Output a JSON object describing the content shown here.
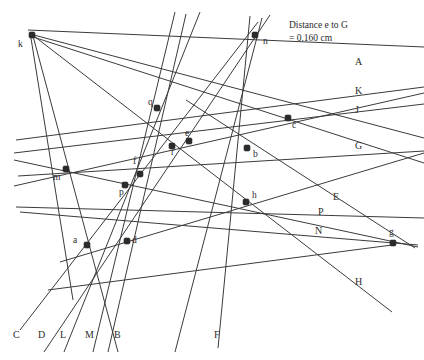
{
  "figure": {
    "width": 424,
    "height": 360,
    "background": "#ffffff",
    "stroke_color": "#3b3b3b",
    "point_color": "#2b2b2b",
    "text_color": "#2b2b2b"
  },
  "measurement": {
    "line1": "Distance e to G",
    "line2": "= 0.160 cm",
    "x": 289,
    "y": 28
  },
  "points": [
    {
      "id": "k",
      "label": "k",
      "x": 32,
      "y": 35,
      "lx": 18,
      "ly": 47
    },
    {
      "id": "n",
      "label": "n",
      "x": 255,
      "y": 35,
      "lx": 263,
      "ly": 44
    },
    {
      "id": "q",
      "label": "q",
      "x": 157,
      "y": 108,
      "lx": 148,
      "ly": 105
    },
    {
      "id": "c",
      "label": "c",
      "x": 288,
      "y": 118,
      "lx": 292,
      "ly": 128
    },
    {
      "id": "e",
      "label": "e",
      "x": 189,
      "y": 141,
      "lx": 185,
      "ly": 136
    },
    {
      "id": "r",
      "label": "r",
      "x": 172,
      "y": 146,
      "lx": 171,
      "ly": 155
    },
    {
      "id": "b",
      "label": "b",
      "x": 247,
      "y": 148,
      "lx": 253,
      "ly": 157
    },
    {
      "id": "m",
      "label": "m",
      "x": 66,
      "y": 169,
      "lx": 53,
      "ly": 180
    },
    {
      "id": "f",
      "label": "f",
      "x": 140,
      "y": 174,
      "lx": 133,
      "ly": 164
    },
    {
      "id": "p",
      "label": "p",
      "x": 125,
      "y": 185,
      "lx": 119,
      "ly": 195
    },
    {
      "id": "h",
      "label": "h",
      "x": 246,
      "y": 202,
      "lx": 252,
      "ly": 198
    },
    {
      "id": "g",
      "label": "g",
      "x": 393,
      "y": 243,
      "lx": 389,
      "ly": 235
    },
    {
      "id": "a",
      "label": "a",
      "x": 87,
      "y": 245,
      "lx": 73,
      "ly": 243
    },
    {
      "id": "d",
      "label": "d",
      "x": 127,
      "y": 241,
      "lx": 132,
      "ly": 243
    }
  ],
  "line_labels": [
    {
      "id": "A",
      "label": "A",
      "x": 355,
      "y": 65
    },
    {
      "id": "K",
      "label": "K",
      "x": 355,
      "y": 94
    },
    {
      "id": "J",
      "label": "J",
      "x": 355,
      "y": 113
    },
    {
      "id": "G",
      "label": "G",
      "x": 355,
      "y": 149
    },
    {
      "id": "E",
      "label": "E",
      "x": 333,
      "y": 200
    },
    {
      "id": "P",
      "label": "P",
      "x": 318,
      "y": 215
    },
    {
      "id": "N",
      "label": "N",
      "x": 315,
      "y": 234
    },
    {
      "id": "H",
      "label": "H",
      "x": 355,
      "y": 285
    },
    {
      "id": "C",
      "label": "C",
      "x": 13,
      "y": 338
    },
    {
      "id": "D",
      "label": "D",
      "x": 38,
      "y": 338
    },
    {
      "id": "L",
      "label": "L",
      "x": 60,
      "y": 338
    },
    {
      "id": "M",
      "label": "M",
      "x": 85,
      "y": 338
    },
    {
      "id": "B",
      "label": "B",
      "x": 114,
      "y": 338
    },
    {
      "id": "F",
      "label": "F",
      "x": 214,
      "y": 338
    }
  ],
  "lines": [
    {
      "id": "line-A",
      "name": "line-A-through-c-to-k",
      "x1": 28,
      "y1": 30,
      "x2": 424,
      "y2": 47
    },
    {
      "id": "line-K",
      "name": "line-K-through-c",
      "x1": 16,
      "y1": 140,
      "x2": 424,
      "y2": 87
    },
    {
      "id": "line-J",
      "name": "line-J-through-b-c",
      "x1": 14,
      "y1": 153,
      "x2": 424,
      "y2": 104
    },
    {
      "id": "line-G",
      "name": "line-G-horizontal",
      "x1": 18,
      "y1": 176,
      "x2": 424,
      "y2": 151
    },
    {
      "id": "line-E",
      "name": "line-E-to-g",
      "x1": 186,
      "y1": 100,
      "x2": 415,
      "y2": 248
    },
    {
      "id": "line-P",
      "name": "line-P-h-to-g",
      "x1": 14,
      "y1": 160,
      "x2": 418,
      "y2": 247
    },
    {
      "id": "line-N",
      "name": "line-N-h-to-g",
      "x1": 20,
      "y1": 212,
      "x2": 418,
      "y2": 245
    },
    {
      "id": "line-H",
      "name": "line-H-from-k",
      "x1": 30,
      "y1": 33,
      "x2": 392,
      "y2": 312
    },
    {
      "id": "line-C",
      "name": "line-C-from-n",
      "x1": 258,
      "y1": 22,
      "x2": 20,
      "y2": 330
    },
    {
      "id": "line-D",
      "name": "line-D-through-d",
      "x1": 270,
      "y1": 15,
      "x2": 44,
      "y2": 352
    },
    {
      "id": "line-L",
      "name": "line-L-through-a-d",
      "x1": 200,
      "y1": 12,
      "x2": 64,
      "y2": 352
    },
    {
      "id": "line-M",
      "name": "line-M-through-p-a",
      "x1": 175,
      "y1": 12,
      "x2": 93,
      "y2": 352
    },
    {
      "id": "line-B",
      "name": "line-B-through-q-f",
      "x1": 33,
      "y1": 36,
      "x2": 118,
      "y2": 352
    },
    {
      "id": "line-F",
      "name": "line-F-vertical",
      "x1": 250,
      "y1": 16,
      "x2": 218,
      "y2": 348
    },
    {
      "id": "line-km",
      "name": "line-k-through-m-to-bottom",
      "x1": 30,
      "y1": 32,
      "x2": 73,
      "y2": 300
    },
    {
      "id": "line-kc",
      "name": "line-k-to-c-right",
      "x1": 30,
      "y1": 34,
      "x2": 424,
      "y2": 138
    },
    {
      "id": "line-kb",
      "name": "line-k-to-b-right",
      "x1": 30,
      "y1": 36,
      "x2": 424,
      "y2": 163
    },
    {
      "id": "line-ag",
      "name": "line-a-d-to-right",
      "x1": 60,
      "y1": 262,
      "x2": 424,
      "y2": 153
    },
    {
      "id": "line-mq",
      "name": "line-m-to-upper-right",
      "x1": 14,
      "y1": 186,
      "x2": 424,
      "y2": 93
    },
    {
      "id": "line-ph",
      "name": "line-p-to-h-extended",
      "x1": 16,
      "y1": 207,
      "x2": 424,
      "y2": 218
    },
    {
      "id": "line-bn",
      "name": "line-b-to-n-lower",
      "x1": 262,
      "y1": 18,
      "x2": 175,
      "y2": 352
    },
    {
      "id": "line-fq",
      "name": "line-f-q-steep",
      "x1": 186,
      "y1": 14,
      "x2": 108,
      "y2": 352
    },
    {
      "id": "line-gh2",
      "name": "line-g-h-long",
      "x1": 392,
      "y1": 245,
      "x2": 48,
      "y2": 290
    }
  ]
}
